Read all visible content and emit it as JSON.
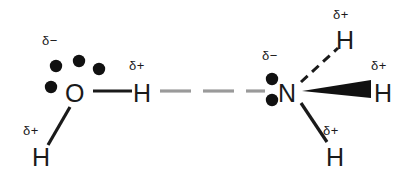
{
  "figure": {
    "kind": "hydrogen-bond-diagram",
    "background_color": "#ffffff",
    "ink_color": "#1a1a1a",
    "hbond_color": "#999999"
  },
  "water": {
    "oxygen": {
      "label": "O",
      "x": 73,
      "y": 95
    },
    "oxygen_charge": {
      "label": "δ−",
      "x": 47,
      "y": 42
    },
    "lone_pair_dots": [
      {
        "cx": 56,
        "cy": 66,
        "r": 6
      },
      {
        "cx": 79,
        "cy": 61,
        "r": 6
      },
      {
        "cx": 99,
        "cy": 69,
        "r": 6
      },
      {
        "cx": 51,
        "cy": 87,
        "r": 6
      }
    ],
    "hydrogen_right": {
      "label": "H",
      "x": 141,
      "y": 95
    },
    "hydrogen_right_charge": {
      "label": "δ+",
      "x": 133,
      "y": 67
    },
    "hydrogen_down": {
      "label": "H",
      "x": 40,
      "y": 157
    },
    "hydrogen_down_charge": {
      "label": "δ+",
      "x": 27,
      "y": 131
    }
  },
  "ammonia": {
    "nitrogen": {
      "label": "N",
      "x": 286,
      "y": 95
    },
    "nitrogen_charge": {
      "label": "δ−",
      "x": 266,
      "y": 57
    },
    "lone_pair_dots": [
      {
        "cx": 271,
        "cy": 79,
        "r": 6
      },
      {
        "cx": 271,
        "cy": 99,
        "r": 6
      }
    ],
    "hydrogen_up": {
      "label": "H",
      "x": 344,
      "y": 42
    },
    "hydrogen_up_charge": {
      "label": "δ+",
      "x": 337,
      "y": 16
    },
    "hydrogen_right": {
      "label": "H",
      "x": 382,
      "y": 95
    },
    "hydrogen_right_charge": {
      "label": "δ+",
      "x": 375,
      "y": 67
    },
    "hydrogen_down": {
      "label": "H",
      "x": 334,
      "y": 157
    },
    "hydrogen_down_charge": {
      "label": "δ+",
      "x": 327,
      "y": 131
    }
  },
  "bonds": {
    "o_h_single": {
      "type": "solid",
      "x1": 93,
      "y1": 91,
      "x2": 132,
      "y2": 91
    },
    "o_h_down": {
      "type": "solid",
      "x1": 70,
      "y1": 106,
      "x2": 48,
      "y2": 144
    },
    "hydrogen_bond": {
      "type": "dashed",
      "x1": 157,
      "y1": 91,
      "x2": 262,
      "y2": 91,
      "dashes": 3
    },
    "n_h_up": {
      "type": "hashed",
      "x1": 300,
      "y1": 82,
      "x2": 338,
      "y2": 47
    },
    "n_h_wedge": {
      "type": "wedge",
      "x1": 300,
      "y1": 92,
      "x2": 372,
      "y2": 89
    },
    "n_h_down": {
      "type": "solid",
      "x1": 300,
      "y1": 103,
      "x2": 327,
      "y2": 143
    }
  }
}
